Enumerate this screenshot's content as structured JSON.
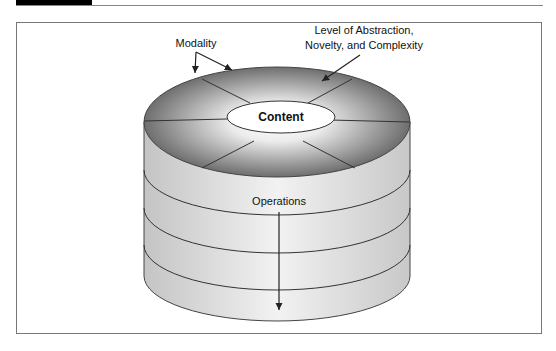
{
  "figure": {
    "labels": {
      "modality": "Modality",
      "level_line1": "Level of Abstraction,",
      "level_line2": "Novelty, and Complexity",
      "content": "Content",
      "operations": "Operations"
    },
    "layers": 4,
    "sectors": 8,
    "colors": {
      "top_dark": "#6e6e6e",
      "top_light": "#f4f4f4",
      "side_light": "#f0f0f0",
      "side_dark": "#bdbdbd",
      "line": "#333333"
    }
  }
}
